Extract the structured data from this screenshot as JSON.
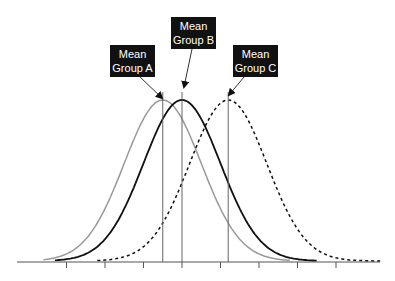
{
  "chart_data": {
    "type": "line",
    "title": "",
    "xlabel": "",
    "ylabel": "",
    "grid": false,
    "legend": "none",
    "axis": {
      "x_ticks_count": 8,
      "tick_labels": []
    },
    "series": [
      {
        "name": "Group A",
        "mean": -0.5,
        "sd": 1.0,
        "style": "solid",
        "color": "#999999"
      },
      {
        "name": "Group B",
        "mean": 0.0,
        "sd": 1.0,
        "style": "solid",
        "color": "#111111"
      },
      {
        "name": "Group C",
        "mean": 1.2,
        "sd": 1.0,
        "style": "dashed",
        "color": "#111111"
      }
    ],
    "annotations": [
      {
        "text": "Mean Group A",
        "points_to": "Group A mean"
      },
      {
        "text": "Mean Group B",
        "points_to": "Group B mean"
      },
      {
        "text": "Mean Group C",
        "points_to": "Group C mean"
      }
    ]
  },
  "labels": {
    "a": {
      "line1": "Mean",
      "line2": "Group A"
    },
    "b": {
      "line1": "Mean",
      "line2": "Group B"
    },
    "c": {
      "line1": "Mean",
      "line2": "Group C"
    }
  },
  "colors": {
    "group_a": "#999999",
    "group_b": "#111111",
    "group_c": "#111111",
    "axis": "#555555",
    "box": "#111111"
  }
}
